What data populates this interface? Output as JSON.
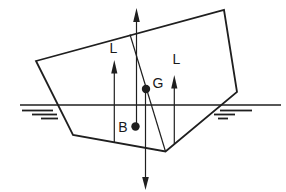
{
  "figure": {
    "type": "ship-stability-line-diagram",
    "colors": {
      "background": "#ffffff",
      "ink": "#1f1f1f"
    },
    "labels": {
      "center_of_gravity": "G",
      "center_of_buoyancy": "B",
      "left_vertical": "L",
      "right_vertical": "L"
    }
  }
}
